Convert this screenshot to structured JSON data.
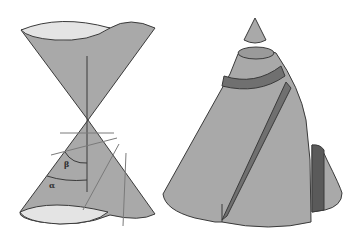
{
  "figure": {
    "left": {
      "name": "double-cone-with-planes",
      "labels": {
        "alpha": "α",
        "beta": "β"
      }
    },
    "right": {
      "name": "conic-sections-cut-cone"
    }
  },
  "colors": {
    "background": "#ffffff",
    "cone_fill": "#a9a9a9",
    "cone_rim": "#e4e4e4",
    "stroke": "#3a3a3a",
    "band_dark": "#707070",
    "section_dark": "#5a5a5a",
    "plane_line": "#7a7a7a"
  }
}
